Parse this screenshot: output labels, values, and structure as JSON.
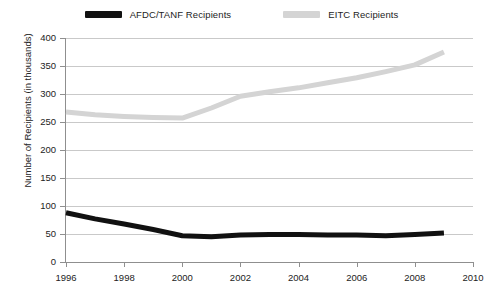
{
  "legend": {
    "entries": [
      {
        "label": "AFDC/TANF Recipients",
        "color": "#111111"
      },
      {
        "label": "EITC Recipients",
        "color": "#d4d4d4"
      }
    ]
  },
  "axes": {
    "y_title": "Number of Recipients (in thousands)",
    "y_ticks": [
      "0",
      "50",
      "100",
      "150",
      "200",
      "250",
      "300",
      "350",
      "400"
    ],
    "x_ticks": [
      "1996",
      "1998",
      "2000",
      "2002",
      "2004",
      "2006",
      "2008",
      "2010"
    ]
  },
  "chart_data": {
    "type": "line",
    "title": "",
    "xlabel": "",
    "ylabel": "Number of Recipients (in thousands)",
    "xlim": [
      1996,
      2010
    ],
    "ylim": [
      0,
      400
    ],
    "ytick_step": 50,
    "xtick_step": 2,
    "grid": true,
    "legend_position": "top-center",
    "x": [
      1996,
      1997,
      1998,
      1999,
      2000,
      2001,
      2002,
      2003,
      2004,
      2005,
      2006,
      2007,
      2008,
      2009
    ],
    "series": [
      {
        "name": "AFDC/TANF Recipients",
        "color": "#111111",
        "line_width": 5,
        "values": [
          88,
          77,
          68,
          58,
          47,
          45,
          48,
          49,
          49,
          48,
          48,
          47,
          49,
          52
        ]
      },
      {
        "name": "EITC Recipients",
        "color": "#d4d4d4",
        "line_width": 5,
        "values": [
          268,
          263,
          260,
          258,
          257,
          275,
          296,
          304,
          311,
          320,
          329,
          340,
          352,
          375
        ]
      }
    ]
  }
}
